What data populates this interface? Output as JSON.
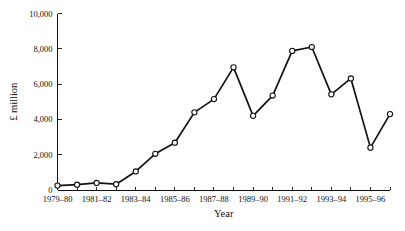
{
  "chart_data": {
    "type": "line",
    "title": "",
    "subtitle": "",
    "xlabel": "Year",
    "ylabel": "£ million",
    "ylim": [
      0,
      10000
    ],
    "ytick_values": [
      0,
      2000,
      4000,
      6000,
      8000,
      10000
    ],
    "ytick_labels": [
      "0",
      "2,000",
      "4,000",
      "6,000",
      "8,000",
      "10,000"
    ],
    "xtick_labels": [
      "1979–80",
      "1981–82",
      "1983–84",
      "1985–86",
      "1987–88",
      "1989–90",
      "1991–92",
      "1993–94",
      "1995–96"
    ],
    "grid": false,
    "legend": false,
    "legend_position": "none",
    "marker": "open-circle",
    "line_color": "#111111",
    "marker_fill": "#ffffff",
    "background": "#ffffff",
    "categories": [
      "1979–80",
      "1980–81",
      "1981–82",
      "1982–83",
      "1983–84",
      "1984–85",
      "1985–86",
      "1986–87",
      "1987–88",
      "1988–89",
      "1989–90",
      "1990–91",
      "1991–92",
      "1992–93",
      "1993–94",
      "1994–95",
      "1995–96",
      "1996–97"
    ],
    "values": [
      250,
      300,
      400,
      330,
      1050,
      2050,
      2680,
      4400,
      5150,
      6950,
      4200,
      5350,
      7880,
      8100,
      5420,
      6320,
      2400,
      4300
    ]
  },
  "axes": {
    "y_axis_name": "y-axis",
    "x_axis_name": "x-axis"
  }
}
